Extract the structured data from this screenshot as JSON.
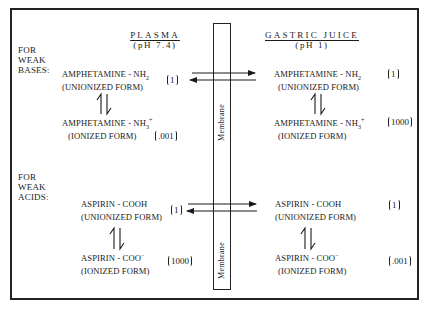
{
  "headers": {
    "plasma": {
      "title": "PLASMA",
      "ph": "(pH 7.4)"
    },
    "gastric": {
      "title": "GASTRIC JUICE",
      "ph": "(pH 1)"
    }
  },
  "membrane": {
    "label": "Membrane"
  },
  "sections": [
    {
      "side_label": [
        "FOR",
        "WEAK",
        "BASES:"
      ],
      "plasma": {
        "unionized": {
          "name": "AMPHETAMINE - NH",
          "sub": "2",
          "form": "(UNIONIZED FORM)",
          "conc": "1"
        },
        "ionized": {
          "name": "AMPHETAMINE - NH",
          "sub": "3",
          "sup": "+",
          "form": "(IONIZED FORM)",
          "conc": ".001"
        }
      },
      "gastric": {
        "unionized": {
          "name": "AMPHETAMINE - NH",
          "sub": "2",
          "form": "(UNIONIZED FORM)",
          "conc": "1"
        },
        "ionized": {
          "name": "AMPHETAMINE - NH",
          "sub": "3",
          "sup": "+",
          "form": "(IONIZED FORM)",
          "conc": "1000"
        }
      }
    },
    {
      "side_label": [
        "FOR",
        "WEAK",
        "ACIDS:"
      ],
      "plasma": {
        "unionized": {
          "name": "ASPIRIN - COOH",
          "form": "(UNIONIZED FORM)",
          "conc": "1"
        },
        "ionized": {
          "name": "ASPIRIN - COO",
          "sup": "−",
          "form": "(IONIZED FORM)",
          "conc": "1000"
        }
      },
      "gastric": {
        "unionized": {
          "name": "ASPIRIN - COOH",
          "form": "(UNIONIZED FORM)",
          "conc": "1"
        },
        "ionized": {
          "name": "ASPIRIN - COO",
          "sup": "−",
          "form": "(IONIZED FORM)",
          "conc": ".001"
        }
      }
    }
  ],
  "colors": {
    "ink": "#1a1a1a",
    "background": "#ffffff"
  }
}
